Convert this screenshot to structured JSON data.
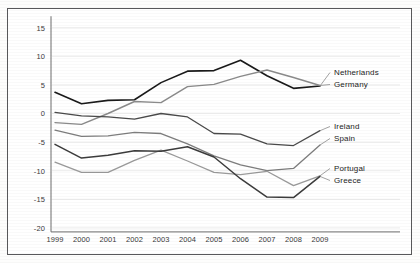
{
  "chart_data": {
    "type": "line",
    "title": "",
    "subtitle": "",
    "xlabel": "",
    "ylabel": "",
    "x": [
      1999,
      2000,
      2001,
      2002,
      2003,
      2004,
      2005,
      2006,
      2007,
      2008,
      2009
    ],
    "xticklabels": [
      "1999",
      "2000",
      "2001",
      "2002",
      "2003",
      "2004",
      "2005",
      "2006",
      "2007",
      "2008",
      "2009"
    ],
    "yticklabels": [
      "15",
      "10",
      "5",
      "0",
      "-5",
      "-10",
      "-15",
      "-20"
    ],
    "ytickvalues": [
      15,
      10,
      5,
      0,
      -5,
      -10,
      -15,
      -20
    ],
    "ylim": [
      -20,
      17
    ],
    "xlim": [
      1999,
      2009
    ],
    "grid": true,
    "legend_position": "right-inline",
    "series": [
      {
        "name": "Netherlands",
        "color": "#1a1a1a",
        "width": 1.6,
        "label_x": 334,
        "label_y": 75,
        "values": [
          3.7,
          1.7,
          2.3,
          2.4,
          5.4,
          7.4,
          7.5,
          9.3,
          6.6,
          4.4,
          4.8
        ]
      },
      {
        "name": "Germany",
        "color": "#8a8a8a",
        "width": 1.4,
        "label_x": 334,
        "label_y": 87,
        "values": [
          -1.6,
          -1.9,
          0.0,
          2.1,
          1.9,
          4.7,
          5.1,
          6.5,
          7.6,
          6.3,
          4.9
        ]
      },
      {
        "name": "Ireland",
        "color": "#4a4a4a",
        "width": 1.3,
        "label_x": 334,
        "label_y": 129,
        "values": [
          0.2,
          -0.4,
          -0.6,
          -1.0,
          0.0,
          -0.6,
          -3.5,
          -3.6,
          -5.3,
          -5.6,
          -3.0
        ]
      },
      {
        "name": "Spain",
        "color": "#7d7d7d",
        "width": 1.3,
        "label_x": 334,
        "label_y": 141,
        "values": [
          -2.9,
          -4.0,
          -3.9,
          -3.3,
          -3.5,
          -5.3,
          -7.4,
          -9.0,
          -10.0,
          -9.6,
          -5.5
        ]
      },
      {
        "name": "Portugal",
        "color": "#9a9a9a",
        "width": 1.3,
        "label_x": 334,
        "label_y": 171,
        "values": [
          -8.5,
          -10.3,
          -10.3,
          -8.2,
          -6.4,
          -8.3,
          -10.3,
          -10.7,
          -10.1,
          -12.6,
          -10.9
        ]
      },
      {
        "name": "Greece",
        "color": "#3c3c3c",
        "width": 1.5,
        "label_x": 334,
        "label_y": 183,
        "values": [
          -5.4,
          -7.8,
          -7.3,
          -6.5,
          -6.6,
          -5.8,
          -7.6,
          -11.4,
          -14.6,
          -14.7,
          -11.0
        ]
      }
    ]
  }
}
